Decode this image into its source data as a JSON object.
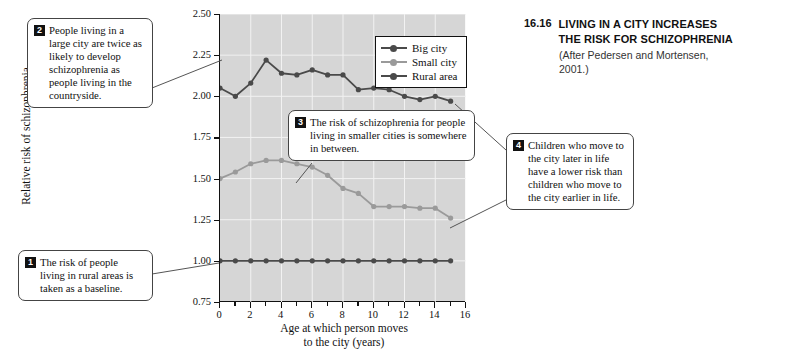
{
  "figure": {
    "number": "16.16",
    "title_line1": "LIVING IN A CITY INCREASES",
    "title_line2": "THE RISK FOR SCHIZOPHRENIA",
    "source_line1": "(After Pedersen and Mortensen,",
    "source_line2": "2001.)"
  },
  "chart_data": {
    "type": "line",
    "title": "",
    "xlabel": "Age at which person moves to the city (years)",
    "xlabel_line1": "Age at which person moves",
    "xlabel_line2": "to the city (years)",
    "ylabel": "Relative risk of schizophrenia",
    "xlim": [
      0,
      16
    ],
    "ylim": [
      0.75,
      2.5
    ],
    "xticks": [
      0,
      2,
      4,
      6,
      8,
      10,
      12,
      14,
      16
    ],
    "xtick_labels": [
      "0",
      "2",
      "4",
      "6",
      "8",
      "10",
      "12",
      "14",
      "16"
    ],
    "xminor_step": 1,
    "yticks": [
      0.75,
      1.0,
      1.25,
      1.5,
      1.75,
      2.0,
      2.25,
      2.5
    ],
    "ytick_labels": [
      "0.75",
      "1.00",
      "1.25",
      "1.50",
      "1.75",
      "2.00",
      "2.25",
      "2.50"
    ],
    "grid": true,
    "legend_position": "top-right",
    "x": [
      0,
      1,
      2,
      3,
      4,
      5,
      6,
      7,
      8,
      9,
      10,
      11,
      12,
      13,
      14,
      15
    ],
    "series": [
      {
        "name": "Big city",
        "color": "#4a4a4a",
        "values": [
          2.05,
          2.0,
          2.08,
          2.22,
          2.14,
          2.13,
          2.16,
          2.13,
          2.13,
          2.04,
          2.05,
          2.04,
          2.0,
          1.98,
          2.0,
          1.97
        ]
      },
      {
        "name": "Small city",
        "color": "#9a9a9a",
        "values": [
          1.5,
          1.54,
          1.59,
          1.61,
          1.61,
          1.59,
          1.57,
          1.52,
          1.44,
          1.41,
          1.33,
          1.33,
          1.33,
          1.32,
          1.32,
          1.26
        ]
      },
      {
        "name": "Rural area",
        "color": "#4a4a4a",
        "values": [
          1.0,
          1.0,
          1.0,
          1.0,
          1.0,
          1.0,
          1.0,
          1.0,
          1.0,
          1.0,
          1.0,
          1.0,
          1.0,
          1.0,
          1.0,
          1.0
        ]
      }
    ]
  },
  "legend": {
    "items": [
      {
        "label": "Big city",
        "color": "#4a4a4a"
      },
      {
        "label": "Small city",
        "color": "#9a9a9a"
      },
      {
        "label": "Rural area",
        "color": "#4a4a4a"
      }
    ]
  },
  "callouts": [
    {
      "number": "1",
      "text": "The risk of people living in rural areas is taken as a baseline."
    },
    {
      "number": "2",
      "text": "People living in a large city are twice as likely to develop schizophrenia as people living in the countryside."
    },
    {
      "number": "3",
      "text": "The risk of schizophrenia for people living in smaller cities is somewhere in between."
    },
    {
      "number": "4",
      "text": "Children who move to the city later in life have a lower risk than children who move to the city earlier in life."
    }
  ]
}
